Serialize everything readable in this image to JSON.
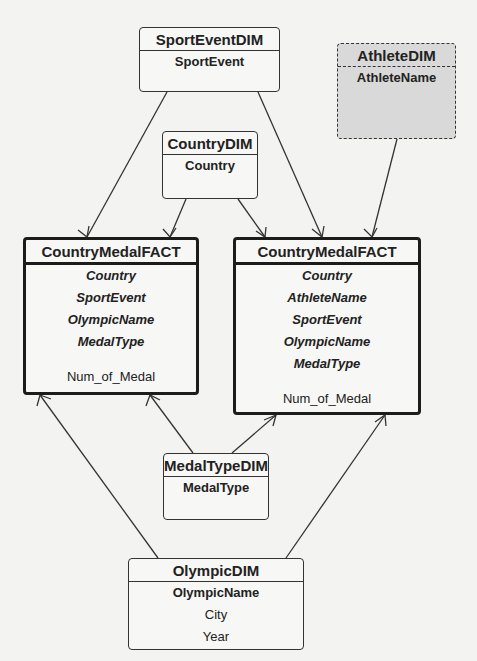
{
  "entities": {
    "sport_event_dim": {
      "title": "SportEventDIM",
      "attributes": [
        "SportEvent"
      ]
    },
    "athlete_dim": {
      "title": "AthleteDIM",
      "attributes": [
        "AthleteName"
      ]
    },
    "country_dim": {
      "title": "CountryDIM",
      "attributes": [
        "Country"
      ]
    },
    "fact_country": {
      "title": "CountryMedalFACT",
      "keys": [
        "Country",
        "SportEvent",
        "OlympicName",
        "MedalType"
      ],
      "measure": "Num_of_Medal"
    },
    "fact_athlete": {
      "title": "CountryMedalFACT",
      "keys": [
        "Country",
        "AthleteName",
        "SportEvent",
        "OlympicName",
        "MedalType"
      ],
      "measure": "Num_of_Medal"
    },
    "medal_type_dim": {
      "title": "MedalTypeDIM",
      "attributes": [
        "MedalType"
      ]
    },
    "olympic_dim": {
      "title": "OlympicDIM",
      "attributes": [
        "OlympicName",
        "City",
        "Year"
      ]
    }
  },
  "relationships": [
    {
      "from": "SportEventDIM",
      "to": "CountryMedalFACT (left)",
      "cardinality": "one-to-many"
    },
    {
      "from": "SportEventDIM",
      "to": "CountryMedalFACT (right)",
      "cardinality": "one-to-many"
    },
    {
      "from": "CountryDIM",
      "to": "CountryMedalFACT (left)",
      "cardinality": "one-to-many"
    },
    {
      "from": "CountryDIM",
      "to": "CountryMedalFACT (right)",
      "cardinality": "one-to-many"
    },
    {
      "from": "AthleteDIM",
      "to": "CountryMedalFACT (right)",
      "cardinality": "one-to-many"
    },
    {
      "from": "MedalTypeDIM",
      "to": "CountryMedalFACT (left)",
      "cardinality": "one-to-many"
    },
    {
      "from": "MedalTypeDIM",
      "to": "CountryMedalFACT (right)",
      "cardinality": "one-to-many"
    },
    {
      "from": "OlympicDIM",
      "to": "CountryMedalFACT (left)",
      "cardinality": "one-to-many"
    },
    {
      "from": "OlympicDIM",
      "to": "CountryMedalFACT (right)",
      "cardinality": "one-to-many"
    }
  ],
  "colors": {
    "line": "#333333",
    "background": "#f3f3f1",
    "dashed_fill": "#d9d9d9"
  }
}
